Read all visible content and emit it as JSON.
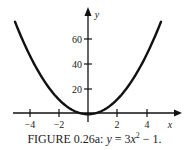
{
  "chart_data": {
    "type": "line",
    "title": "",
    "function": "y = 3x^2 - 1",
    "xlabel": "x",
    "ylabel": "y",
    "xlim": [
      -5,
      5
    ],
    "ylim": [
      -1,
      74
    ],
    "x_ticks": [
      -4,
      -2,
      2,
      4
    ],
    "y_ticks": [
      20,
      40,
      60
    ],
    "series": [
      {
        "name": "y = 3x^2 - 1",
        "x": [
          -5,
          -4,
          -3,
          -2,
          -1,
          0,
          1,
          2,
          3,
          4,
          5
        ],
        "values": [
          74,
          47,
          26,
          11,
          2,
          -1,
          2,
          11,
          26,
          47,
          74
        ]
      }
    ],
    "grid": false,
    "legend": "none"
  },
  "axes": {
    "x_label": "x",
    "y_label": "y",
    "x_tick_labels": [
      "−4",
      "−2",
      "2",
      "4"
    ],
    "y_tick_labels": [
      "20",
      "40",
      "60"
    ]
  },
  "caption": {
    "prefix": "FIGURE 0.26a: ",
    "equation_lhs": "y",
    "equation_rhs_a": " = 3",
    "equation_var": "x",
    "equation_exp": "2",
    "equation_rhs_b": " − 1."
  }
}
